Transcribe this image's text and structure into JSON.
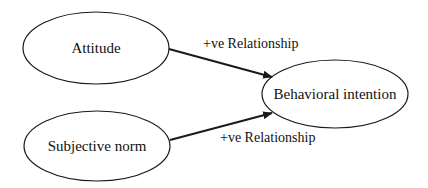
{
  "diagram": {
    "nodes": [
      {
        "id": "attitude",
        "label": "Attitude"
      },
      {
        "id": "subjective_norm",
        "label": "Subjective norm"
      },
      {
        "id": "behavioral_intention",
        "label": "Behavioral intention"
      }
    ],
    "edges": [
      {
        "from": "attitude",
        "to": "behavioral_intention",
        "label": "+ve Relationship"
      },
      {
        "from": "subjective_norm",
        "to": "behavioral_intention",
        "label": "+ve Relationship"
      }
    ],
    "colors": {
      "stroke": "#1a1a1a",
      "background": "#ffffff"
    }
  }
}
